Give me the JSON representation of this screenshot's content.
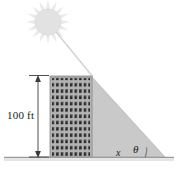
{
  "figure": {
    "labels": {
      "height": "100 ft",
      "shadow_length": "x",
      "angle": "θ"
    },
    "icons": {
      "sun": "sun-icon",
      "building": "building-icon",
      "shadow": "shadow-triangle-icon",
      "ray": "sun-ray-icon",
      "dimension": "dimension-line-icon",
      "angle_arc": "angle-arc-icon",
      "ground": "ground-line-icon"
    },
    "colors": {
      "sun": "#e2e2e2",
      "sun_rays": "#ebebeb",
      "building_fill": "#b3b3b3",
      "building_edge": "#8c8c8c",
      "window": "#262626",
      "shadow_fill": "#c9c9c9",
      "shadow_edge": "#a8a8a8",
      "ray_line": "#cfcfcf",
      "ground_line": "#9a9a9a",
      "dimension_line": "#3a3a3a",
      "text": "#1a1a1a",
      "background": "#ffffff"
    },
    "geometry": {
      "ground_y": 158,
      "building_left": 50,
      "building_right": 92,
      "building_top": 76,
      "shadow_apex_x": 165,
      "sun_center_x": 48,
      "sun_center_y": 22,
      "sun_radius": 13,
      "sun_ray_count": 16,
      "window_columns": 9,
      "window_rows": 13,
      "dimension_x": 38,
      "angle_arc_radius": 20
    }
  }
}
